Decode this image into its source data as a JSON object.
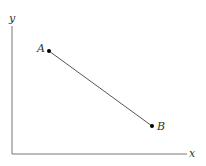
{
  "diagram": {
    "axes": {
      "x_label": "x",
      "y_label": "y",
      "color": "#777777"
    },
    "points": [
      {
        "label": "A",
        "x": 49,
        "y": 51
      },
      {
        "label": "B",
        "x": 152,
        "y": 126
      }
    ],
    "segment": {
      "from": "A",
      "to": "B",
      "color": "#555555"
    }
  }
}
